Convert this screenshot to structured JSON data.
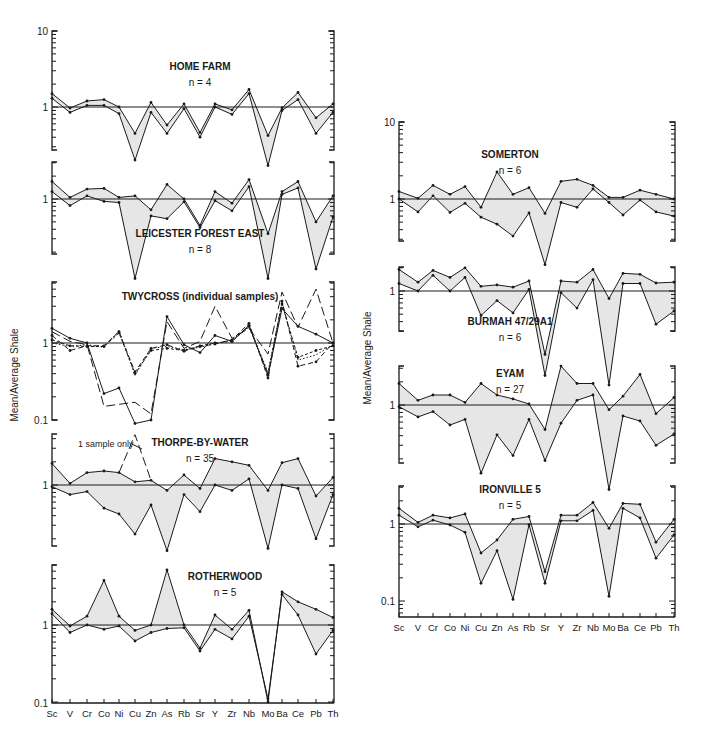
{
  "figure": {
    "ylabel": "Mean/Average Shale",
    "elements": [
      "Sc",
      "V",
      "Cr",
      "Co",
      "Ni",
      "Cu",
      "Zn",
      "As",
      "Rb",
      "Sr",
      "Y",
      "Zr",
      "Nb",
      "Mo",
      "Ba",
      "Ce",
      "Pb",
      "Th"
    ]
  },
  "chart_data": [
    {
      "type": "line",
      "id": "home-farm",
      "title": "HOME FARM",
      "subtitle": "n = 4",
      "column": "left",
      "categories": [
        "Sc",
        "V",
        "Cr",
        "Co",
        "Ni",
        "Cu",
        "Zn",
        "As",
        "Rb",
        "Sr",
        "Y",
        "Zr",
        "Nb",
        "Mo",
        "Ba",
        "Ce",
        "Pb",
        "Th"
      ],
      "ylim": [
        0.28,
        10
      ],
      "yscale": "log",
      "ylabel": "Mean/Average Shale",
      "shade_between": true,
      "series": [
        {
          "name": "upper",
          "style": "solid",
          "values": [
            1.5,
            0.97,
            1.2,
            1.25,
            1.0,
            0.45,
            1.15,
            0.58,
            1.1,
            0.46,
            1.1,
            0.92,
            1.7,
            0.42,
            0.97,
            1.55,
            0.72,
            1.1
          ]
        },
        {
          "name": "lower",
          "style": "solid",
          "values": [
            1.3,
            0.85,
            1.05,
            1.05,
            0.82,
            0.2,
            0.85,
            0.45,
            0.95,
            0.4,
            1.0,
            0.8,
            1.5,
            0.17,
            0.9,
            1.25,
            0.45,
            0.85
          ]
        }
      ],
      "frame_px": {
        "top": 31,
        "bottom": 150,
        "one_y": 107,
        "decade_px": 76
      }
    },
    {
      "type": "line",
      "id": "leicester-forest-east",
      "title": "LEICESTER FOREST EAST",
      "subtitle": "n = 8",
      "column": "left",
      "categories": [
        "Sc",
        "V",
        "Cr",
        "Co",
        "Ni",
        "Cu",
        "Zn",
        "As",
        "Rb",
        "Sr",
        "Y",
        "Zr",
        "Nb",
        "Mo",
        "Ba",
        "Ce",
        "Pb",
        "Th"
      ],
      "ylim": [
        0.28,
        2.9
      ],
      "yscale": "log",
      "shade_between": true,
      "series": [
        {
          "name": "upper",
          "style": "solid",
          "values": [
            1.7,
            1.05,
            1.35,
            1.38,
            1.05,
            1.1,
            0.72,
            1.55,
            1.0,
            0.45,
            1.25,
            0.88,
            1.8,
            0.35,
            1.25,
            1.7,
            0.5,
            1.1
          ]
        },
        {
          "name": "lower",
          "style": "solid",
          "values": [
            1.25,
            0.82,
            1.1,
            0.93,
            0.9,
            0.09,
            0.6,
            0.55,
            0.92,
            0.42,
            0.95,
            0.7,
            1.45,
            0.09,
            1.15,
            1.4,
            0.12,
            0.58
          ]
        }
      ],
      "frame_px": {
        "top": 162,
        "bottom": 254,
        "one_y": 199,
        "decade_px": 76
      }
    },
    {
      "type": "line",
      "id": "twycross",
      "title": "TWYCROSS",
      "subtitle": "(individual samples)",
      "column": "left",
      "categories": [
        "Sc",
        "V",
        "Cr",
        "Co",
        "Ni",
        "Cu",
        "Zn",
        "As",
        "Rb",
        "Sr",
        "Y",
        "Zr",
        "Nb",
        "Mo",
        "Ba",
        "Ce",
        "Pb",
        "Th"
      ],
      "ylim": [
        0.1,
        6
      ],
      "yscale": "log",
      "shade_between": false,
      "series": [
        {
          "name": "sample 1",
          "style": "solid",
          "values": [
            1.55,
            1.15,
            1.0,
            0.22,
            0.26,
            0.09,
            0.1,
            2.2,
            0.95,
            0.75,
            1.25,
            1.05,
            1.7,
            0.38,
            2.8,
            1.65,
            1.3,
            1.0
          ]
        },
        {
          "name": "sample 2",
          "style": "long-dash",
          "values": [
            1.4,
            1.05,
            0.95,
            0.15,
            0.16,
            0.17,
            0.12,
            1.9,
            0.85,
            1.05,
            3.0,
            1.15,
            1.55,
            0.72,
            4.6,
            1.6,
            5.0,
            1.0
          ]
        },
        {
          "name": "sample 3",
          "style": "dash",
          "values": [
            1.25,
            0.8,
            0.92,
            0.92,
            1.4,
            0.42,
            0.85,
            0.95,
            0.78,
            0.9,
            0.97,
            1.1,
            1.8,
            0.35,
            3.5,
            0.5,
            0.57,
            1.0
          ]
        },
        {
          "name": "sample 4",
          "style": "short-dash",
          "values": [
            1.1,
            0.92,
            0.9,
            0.9,
            1.35,
            0.4,
            0.8,
            0.85,
            0.8,
            0.92,
            1.0,
            1.05,
            1.65,
            0.4,
            3.2,
            0.65,
            0.8,
            0.92
          ]
        },
        {
          "name": "sample 5",
          "style": "dot",
          "values": [
            1.0,
            0.9,
            0.95,
            0.88,
            1.45,
            0.38,
            0.85,
            0.9,
            0.82,
            0.88,
            0.98,
            1.1,
            1.6,
            0.42,
            3.3,
            0.6,
            0.7,
            0.95
          ]
        }
      ],
      "frame_px": {
        "top": 282,
        "bottom": 420,
        "one_y": 343,
        "decade_px": 77
      }
    },
    {
      "type": "line",
      "id": "thorpe-by-water",
      "title": "THORPE-BY-WATER",
      "subtitle": "n = 35",
      "column": "left",
      "categories": [
        "Sc",
        "V",
        "Cr",
        "Co",
        "Ni",
        "Cu",
        "Zn",
        "As",
        "Rb",
        "Sr",
        "Y",
        "Zr",
        "Nb",
        "Mo",
        "Ba",
        "Ce",
        "Pb",
        "Th"
      ],
      "ylim": [
        0.2,
        4.5
      ],
      "yscale": "log",
      "shade_between": true,
      "annotation": {
        "text": "1 sample only",
        "element": "Cu",
        "value": 4.5
      },
      "series": [
        {
          "name": "upper",
          "style": "solid",
          "values": [
            1.9,
            1.05,
            1.45,
            1.52,
            1.45,
            1.1,
            1.15,
            0.85,
            1.35,
            0.9,
            2.2,
            2.0,
            1.8,
            0.85,
            1.95,
            2.2,
            0.72,
            1.25
          ]
        },
        {
          "name": "lower",
          "style": "solid",
          "values": [
            0.95,
            0.75,
            0.82,
            0.5,
            0.42,
            0.23,
            0.55,
            0.14,
            0.75,
            0.45,
            1.0,
            0.85,
            1.2,
            0.15,
            1.0,
            0.9,
            0.2,
            0.75
          ]
        },
        {
          "name": "1 sample only",
          "style": "long-dash",
          "values": [
            null,
            null,
            null,
            null,
            1.45,
            4.5,
            1.15,
            null,
            null,
            null,
            null,
            null,
            null,
            null,
            null,
            null,
            null,
            null
          ]
        }
      ],
      "frame_px": {
        "top": 434,
        "bottom": 546,
        "one_y": 485,
        "decade_px": 77
      }
    },
    {
      "type": "line",
      "id": "rotherwood",
      "title": "ROTHERWOOD",
      "subtitle": "n = 5",
      "column": "left",
      "categories": [
        "Sc",
        "V",
        "Cr",
        "Co",
        "Ni",
        "Cu",
        "Zn",
        "As",
        "Rb",
        "Sr",
        "Y",
        "Zr",
        "Nb",
        "Mo",
        "Ba",
        "Ce",
        "Pb",
        "Th"
      ],
      "ylim": [
        0.1,
        5.5
      ],
      "yscale": "log",
      "shade_between": true,
      "series": [
        {
          "name": "upper",
          "style": "solid",
          "values": [
            1.6,
            0.97,
            1.3,
            3.8,
            1.3,
            0.85,
            1.0,
            5.2,
            1.0,
            0.5,
            1.35,
            0.88,
            1.55,
            0.1,
            2.7,
            2.0,
            1.6,
            1.25
          ]
        },
        {
          "name": "lower",
          "style": "solid",
          "values": [
            1.4,
            0.8,
            1.0,
            0.88,
            0.97,
            0.62,
            0.8,
            0.9,
            0.92,
            0.46,
            0.88,
            0.66,
            1.3,
            0.11,
            2.5,
            1.35,
            0.42,
            0.85
          ]
        }
      ],
      "frame_px": {
        "top": 565,
        "bottom": 703,
        "one_y": 625,
        "decade_px": 77
      }
    },
    {
      "type": "line",
      "id": "somerton",
      "title": "SOMERTON",
      "subtitle": "n = 6",
      "column": "right",
      "categories": [
        "Sc",
        "V",
        "Cr",
        "Co",
        "Ni",
        "Cu",
        "Zn",
        "As",
        "Rb",
        "Sr",
        "Y",
        "Zr",
        "Nb",
        "Mo",
        "Ba",
        "Ce",
        "Pb",
        "Th"
      ],
      "ylim": [
        0.28,
        10
      ],
      "yscale": "log",
      "shade_between": true,
      "series": [
        {
          "name": "upper",
          "style": "solid",
          "values": [
            1.25,
            1.02,
            1.5,
            1.15,
            1.45,
            0.78,
            2.25,
            1.15,
            1.4,
            0.65,
            1.7,
            1.8,
            1.5,
            1.05,
            1.05,
            1.3,
            1.15,
            1.0
          ]
        },
        {
          "name": "lower",
          "style": "solid",
          "values": [
            1.0,
            0.68,
            1.1,
            0.67,
            0.88,
            0.58,
            0.47,
            0.33,
            0.66,
            0.14,
            0.9,
            0.78,
            1.35,
            0.9,
            0.62,
            0.97,
            0.68,
            0.6
          ]
        }
      ],
      "frame_px": {
        "top": 122,
        "bottom": 241,
        "one_y": 199,
        "decade_px": 77
      }
    },
    {
      "type": "line",
      "id": "burmah-47-29a1",
      "title": "BURMAH 47/29A1",
      "subtitle": "n = 6",
      "column": "right",
      "categories": [
        "Sc",
        "V",
        "Cr",
        "Co",
        "Ni",
        "Cu",
        "Zn",
        "As",
        "Rb",
        "Sr",
        "Y",
        "Zr",
        "Nb",
        "Mo",
        "Ba",
        "Ce",
        "Pb",
        "Th"
      ],
      "ylim": [
        0.3,
        2.2
      ],
      "yscale": "log",
      "shade_between": true,
      "series": [
        {
          "name": "upper",
          "style": "solid",
          "values": [
            1.9,
            1.3,
            1.85,
            1.5,
            2.0,
            1.15,
            1.2,
            1.12,
            1.35,
            0.15,
            1.35,
            1.3,
            1.9,
            0.8,
            1.7,
            1.65,
            1.27,
            1.3
          ]
        },
        {
          "name": "lower",
          "style": "solid",
          "values": [
            1.25,
            1.0,
            1.6,
            1.0,
            1.5,
            0.48,
            0.75,
            0.52,
            1.05,
            0.08,
            0.95,
            0.6,
            1.4,
            0.06,
            1.25,
            1.25,
            0.37,
            0.55
          ]
        }
      ],
      "frame_px": {
        "top": 267,
        "bottom": 331,
        "one_y": 291,
        "decade_px": 77
      }
    },
    {
      "type": "line",
      "id": "eyam",
      "title": "EYAM",
      "subtitle": "n = 27",
      "column": "right",
      "categories": [
        "Sc",
        "V",
        "Cr",
        "Co",
        "Ni",
        "Cu",
        "Zn",
        "As",
        "Rb",
        "Sr",
        "Y",
        "Zr",
        "Nb",
        "Mo",
        "Ba",
        "Ce",
        "Pb",
        "Th"
      ],
      "ylim": [
        0.18,
        3.2
      ],
      "yscale": "log",
      "shade_between": true,
      "series": [
        {
          "name": "upper",
          "style": "solid",
          "values": [
            1.9,
            1.15,
            1.35,
            1.35,
            1.08,
            1.9,
            1.35,
            1.2,
            1.03,
            0.48,
            3.2,
            1.9,
            1.9,
            0.87,
            1.3,
            2.5,
            0.77,
            1.25
          ]
        },
        {
          "name": "lower",
          "style": "solid",
          "values": [
            0.95,
            0.7,
            0.82,
            0.55,
            0.65,
            0.13,
            0.41,
            0.22,
            0.65,
            0.19,
            0.58,
            1.15,
            1.35,
            0.08,
            0.72,
            0.62,
            0.3,
            0.42
          ]
        }
      ],
      "frame_px": {
        "top": 366,
        "bottom": 463,
        "one_y": 405,
        "decade_px": 77
      }
    },
    {
      "type": "line",
      "id": "ironville-5",
      "title": "IRONVILLE 5",
      "subtitle": "n = 5",
      "column": "right",
      "categories": [
        "Sc",
        "V",
        "Cr",
        "Co",
        "Ni",
        "Cu",
        "Zn",
        "As",
        "Rb",
        "Sr",
        "Y",
        "Zr",
        "Nb",
        "Mo",
        "Ba",
        "Ce",
        "Pb",
        "Th"
      ],
      "ylim": [
        0.08,
        3.2
      ],
      "yscale": "log",
      "shade_between": true,
      "series": [
        {
          "name": "upper",
          "style": "solid",
          "values": [
            1.6,
            1.05,
            1.3,
            1.2,
            1.35,
            0.42,
            0.62,
            1.15,
            1.25,
            0.24,
            1.3,
            1.3,
            1.9,
            0.88,
            1.85,
            1.8,
            0.58,
            1.15
          ]
        },
        {
          "name": "lower",
          "style": "solid",
          "values": [
            1.3,
            0.92,
            1.12,
            0.97,
            0.78,
            0.17,
            0.45,
            0.105,
            0.98,
            0.17,
            1.1,
            1.1,
            1.5,
            0.115,
            1.6,
            1.2,
            0.36,
            0.72
          ]
        }
      ],
      "frame_px": {
        "top": 486,
        "bottom": 617,
        "one_y": 524,
        "decade_px": 77
      }
    }
  ],
  "columns": {
    "left": {
      "x_left": 52,
      "x_right": 334,
      "x_positions": [
        52,
        70,
        87,
        104,
        119,
        135,
        151,
        167,
        184,
        200,
        215,
        232,
        249,
        268,
        282,
        298,
        316,
        333
      ],
      "axis_y": 703,
      "ylabel_x": 18,
      "ylabel_y": 375
    },
    "right": {
      "x_left": 399,
      "x_right": 675,
      "x_positions": [
        399,
        418,
        433,
        450,
        465,
        481,
        497,
        513,
        529,
        545,
        561,
        577,
        593,
        609,
        623,
        640,
        656,
        674
      ],
      "axis_y": 617,
      "ylabel_x": 371,
      "ylabel_y": 358
    }
  },
  "tick_labels": {
    "left": [
      {
        "text": "10",
        "y": 31
      },
      {
        "text": "1",
        "y": 107
      },
      {
        "text": "1",
        "y": 199
      },
      {
        "text": "1",
        "y": 343
      },
      {
        "text": "0.1",
        "y": 420
      },
      {
        "text": "1",
        "y": 485
      },
      {
        "text": "1",
        "y": 625
      },
      {
        "text": "0.1",
        "y": 703
      }
    ],
    "right": [
      {
        "text": "10",
        "y": 122
      },
      {
        "text": "1",
        "y": 199
      },
      {
        "text": "1",
        "y": 291
      },
      {
        "text": "1",
        "y": 405
      },
      {
        "text": "1",
        "y": 524
      },
      {
        "text": "0.1",
        "y": 601
      }
    ]
  },
  "panel_labels": {
    "home-farm": {
      "x": 200,
      "y": 70
    },
    "leicester-forest-east": {
      "x": 200,
      "y": 237
    },
    "twycross": {
      "x": 200,
      "y": 300
    },
    "thorpe-by-water": {
      "x": 200,
      "y": 446
    },
    "rotherwood": {
      "x": 225,
      "y": 580
    },
    "somerton": {
      "x": 510,
      "y": 158
    },
    "burmah-47-29a1": {
      "x": 510,
      "y": 325
    },
    "eyam": {
      "x": 510,
      "y": 377
    },
    "ironville-5": {
      "x": 510,
      "y": 493
    }
  }
}
